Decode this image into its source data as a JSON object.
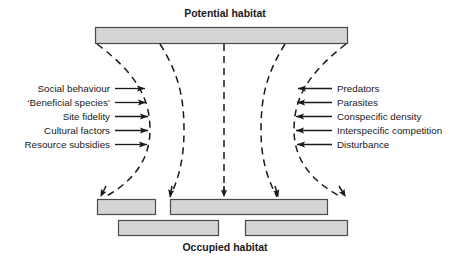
{
  "figure": {
    "top_heading": "Potential habitat",
    "bottom_heading": "Occupied habitat"
  },
  "left_factors": [
    {
      "label": "Social behaviour"
    },
    {
      "label": "‘Beneficial species’"
    },
    {
      "label": "Site fidelity"
    },
    {
      "label": "Cultural factors"
    },
    {
      "label": "Resource subsidies"
    }
  ],
  "right_factors": [
    {
      "label": "Predators"
    },
    {
      "label": "Parasites"
    },
    {
      "label": "Conspecific density"
    },
    {
      "label": "Interspecific competition"
    },
    {
      "label": "Disturbance"
    }
  ],
  "colors": {
    "bar_fill": "#d5d5d5",
    "bar_stroke": "#4a4a4a",
    "line": "#1a1a1a",
    "text": "#1a1a1a",
    "background": "#ffffff"
  }
}
